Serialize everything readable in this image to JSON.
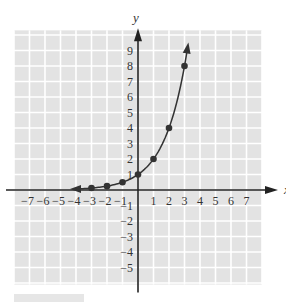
{
  "chart_data": {
    "type": "line",
    "title": "",
    "xlabel": "x",
    "ylabel": "y",
    "xlim": [
      -8,
      8
    ],
    "ylim": [
      -6,
      10
    ],
    "grid": true,
    "x_ticks": [
      -7,
      -6,
      -5,
      -4,
      -3,
      -2,
      -1,
      1,
      2,
      3,
      4,
      5,
      6,
      7
    ],
    "y_ticks": [
      -5,
      -4,
      -3,
      -2,
      -1,
      1,
      2,
      3,
      4,
      5,
      6,
      7,
      8,
      9
    ],
    "x_tick_labels": [
      "−7",
      "−6",
      "−5",
      "−4",
      "−3",
      "−2",
      "−1",
      "1",
      "2",
      "3",
      "4",
      "5",
      "6",
      "7"
    ],
    "y_tick_labels": [
      "−5",
      "−4",
      "−3",
      "−2",
      "−1",
      "1",
      "2",
      "3",
      "4",
      "5",
      "6",
      "7",
      "8",
      "9"
    ],
    "series": [
      {
        "name": "y = 2^x",
        "function": "2^x",
        "curve_range": [
          -4,
          3.2
        ],
        "points": [
          {
            "x": -3,
            "y": 0.125
          },
          {
            "x": -2,
            "y": 0.25
          },
          {
            "x": -1,
            "y": 0.5
          },
          {
            "x": 0,
            "y": 1
          },
          {
            "x": 1,
            "y": 2
          },
          {
            "x": 2,
            "y": 4
          },
          {
            "x": 3,
            "y": 8
          }
        ]
      }
    ]
  }
}
